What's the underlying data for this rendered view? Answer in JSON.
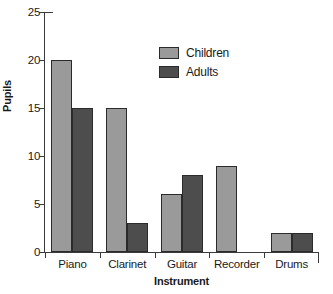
{
  "chart_data": {
    "type": "bar",
    "title": "",
    "subtitle": "",
    "xlabel": "Instrument",
    "ylabel": "Pupils",
    "categories": [
      "Piano",
      "Clarinet",
      "Guitar",
      "Recorder",
      "Drums"
    ],
    "series": [
      {
        "name": "Children",
        "color": "#9a9a9a",
        "values": [
          20,
          15,
          6,
          9,
          2
        ]
      },
      {
        "name": "Adults",
        "color": "#4d4d4d",
        "values": [
          15,
          3,
          8,
          0,
          2
        ]
      }
    ],
    "ylim": [
      0,
      25
    ],
    "yticks": [
      0,
      5,
      10,
      15,
      20,
      25
    ],
    "ytick_labels": [
      "0",
      "5",
      "10",
      "15",
      "20",
      "25"
    ],
    "grid": false,
    "legend_position": "upper-center-right",
    "bar_outline_color": "#2b2b2b",
    "axis_color": "#3a3a3a",
    "background": "#ffffff"
  },
  "legend": {
    "entries": [
      {
        "label": "Children",
        "swatch": "children"
      },
      {
        "label": "Adults",
        "swatch": "adults"
      }
    ]
  },
  "axes": {
    "y_title": "Pupils",
    "x_title": "Instrument"
  }
}
